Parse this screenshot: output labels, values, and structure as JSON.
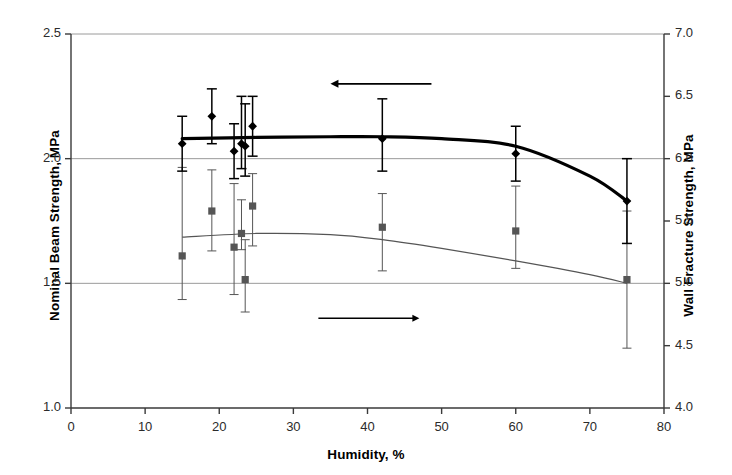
{
  "chart_data": {
    "type": "scatter",
    "title": "",
    "xlabel": "Humidity, %",
    "ylabel": "Nominal Beam Strength, MPa",
    "y2label": "Wall Fracture Strength, MPa",
    "xlim": [
      0,
      80
    ],
    "ylim": [
      1.0,
      2.5
    ],
    "y2lim": [
      4.0,
      7.0
    ],
    "xticks": [
      0,
      10,
      20,
      30,
      40,
      50,
      60,
      70,
      80
    ],
    "xtick_labels": [
      "0",
      "10",
      "20",
      "30",
      "40",
      "50",
      "60",
      "70",
      "80"
    ],
    "yticks": [
      1.0,
      1.5,
      2.0,
      2.5
    ],
    "ytick_labels": [
      "1.0",
      "1.5",
      "2.0",
      "2.5"
    ],
    "y2ticks": [
      4.0,
      4.5,
      5.0,
      5.5,
      6.0,
      6.5,
      7.0
    ],
    "y2tick_labels": [
      "4.0",
      "4.5",
      "5.0",
      "5.5",
      "6.0",
      "6.5",
      "7.0"
    ],
    "grid": "horizontal gridlines at left-axis 1.5, 2.0, 2.5",
    "legend": "none; arrows indicate which axis each series belongs to",
    "annotations": [
      {
        "name": "left-pointing-arrow",
        "text": "",
        "x": 35.0,
        "y": 2.3,
        "direction": "left",
        "note": "points to left axis for diamond series"
      },
      {
        "name": "right-pointing-arrow",
        "text": "",
        "x": 47.0,
        "y": 1.36,
        "direction": "right",
        "note": "points to right axis for square series"
      }
    ],
    "series": [
      {
        "name": "Nominal Beam Strength",
        "axis": "left",
        "marker": "diamond",
        "color": "#000000",
        "line": "thick smooth trend curve",
        "x": [
          15.0,
          19.0,
          22.0,
          23.0,
          23.5,
          24.5,
          42.0,
          60.0,
          75.0
        ],
        "values": [
          2.06,
          2.17,
          2.03,
          2.06,
          2.05,
          2.13,
          2.08,
          2.02,
          1.83
        ],
        "err_low": [
          1.95,
          2.06,
          1.92,
          1.96,
          1.93,
          2.01,
          1.95,
          1.91,
          1.66
        ],
        "err_high": [
          2.17,
          2.28,
          2.14,
          2.25,
          2.22,
          2.25,
          2.24,
          2.13,
          2.0
        ],
        "trend_x": [
          15,
          25,
          35,
          42,
          50,
          60,
          70,
          75
        ],
        "trend_y": [
          2.08,
          2.085,
          2.088,
          2.088,
          2.08,
          2.05,
          1.93,
          1.83
        ]
      },
      {
        "name": "Wall Fracture Strength",
        "axis": "right",
        "marker": "square",
        "color": "#555555",
        "line": "thin smooth trend curve",
        "x": [
          15.0,
          19.0,
          22.0,
          23.0,
          23.5,
          24.5,
          42.0,
          60.0,
          75.0
        ],
        "values": [
          5.22,
          5.58,
          5.29,
          5.4,
          5.03,
          5.62,
          5.45,
          5.42,
          5.03
        ],
        "err_low": [
          4.87,
          5.26,
          4.91,
          5.27,
          4.77,
          5.3,
          5.1,
          5.12,
          4.48
        ],
        "err_high": [
          5.93,
          5.91,
          5.8,
          5.67,
          5.35,
          5.88,
          5.72,
          5.78,
          5.58
        ],
        "trend_x": [
          15,
          25,
          35,
          42,
          50,
          60,
          70,
          75
        ],
        "trend_y": [
          5.37,
          5.4,
          5.39,
          5.35,
          5.28,
          5.18,
          5.07,
          5.0
        ]
      }
    ]
  },
  "axes": {
    "xlabel": "Humidity, %",
    "ylabel_left": "Nominal Beam Strength, MPa",
    "ylabel_right": "Wall Fracture Strength, MPa"
  },
  "ticks": {
    "left": [
      "2.5",
      "2.0",
      "1.5",
      "1.0"
    ],
    "right": [
      "7.0",
      "6.5",
      "6.0",
      "5.5",
      "5.0",
      "4.5",
      "4.0"
    ],
    "bottom": [
      "0",
      "10",
      "20",
      "30",
      "40",
      "50",
      "60",
      "70",
      "80"
    ]
  },
  "colors": {
    "series1": "#000000",
    "series2": "#555555",
    "grid": "#9a9a9a",
    "axis": "#3a3a3a",
    "background": "#ffffff"
  }
}
